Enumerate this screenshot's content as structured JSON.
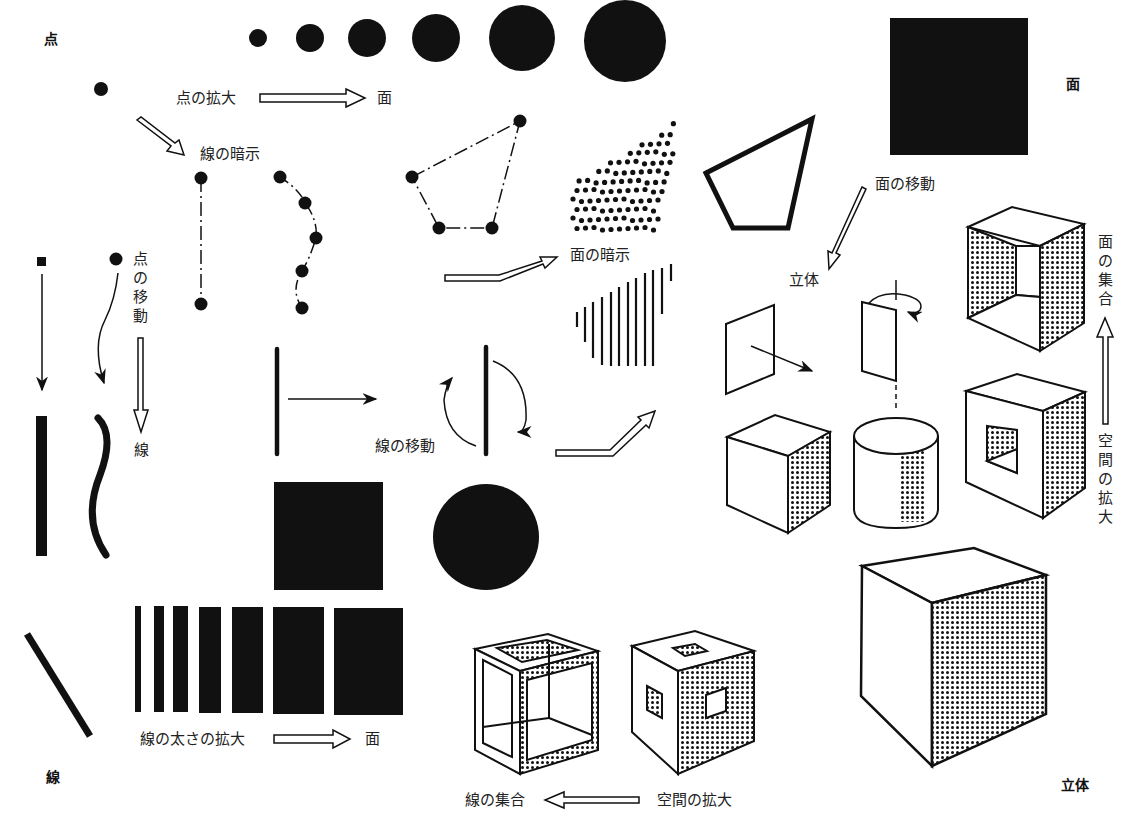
{
  "diagram": {
    "type": "concept-diagram",
    "theme": "point-line-plane-solid",
    "colors": {
      "ink": "#111111",
      "paper": "#ffffff",
      "text": "#222222"
    },
    "corner_labels": {
      "point": "点",
      "plane": "面",
      "line": "線",
      "solid": "立体"
    },
    "labels": {
      "point_enlarge": "点の拡大",
      "point_enlarge_result": "面",
      "line_suggestion": "線の暗示",
      "point_movement": "点の移動",
      "point_movement_result": "線",
      "plane_suggestion": "面の暗示",
      "line_movement": "線の移動",
      "plane_movement": "面の移動",
      "plane_movement_result": "立体",
      "plane_collection": "面の集合",
      "space_enlarge_right": "空間の拡大",
      "line_thickness_enlarge": "線の太さの拡大",
      "line_thickness_result": "面",
      "line_collection": "線の集合",
      "space_enlarge_bottom": "空間の拡大"
    },
    "nodes": [
      {
        "id": "growing-dots",
        "count": 6,
        "description": "dots increasing in size"
      },
      {
        "id": "single-point",
        "description": "single dot"
      },
      {
        "id": "dotted-line-suggestion",
        "description": "two dots connected by dash-dot line"
      },
      {
        "id": "dotted-curve-suggestion",
        "description": "five dots along dash-dot curve"
      },
      {
        "id": "dotted-quadrilateral",
        "description": "four dots joined by dash-dot lines"
      },
      {
        "id": "dot-field",
        "description": "field of dots forming a plane"
      },
      {
        "id": "hatch-field",
        "description": "parallel lines forming a plane"
      },
      {
        "id": "pentagon-outline",
        "description": "thick outlined pentagon"
      },
      {
        "id": "black-square-plane",
        "description": "large black square"
      },
      {
        "id": "line-translation",
        "description": "vertical bar with arrow"
      },
      {
        "id": "line-rotation",
        "description": "vertical bar with rotation arrows"
      },
      {
        "id": "black-square",
        "description": "black square"
      },
      {
        "id": "black-circle",
        "description": "black circle"
      },
      {
        "id": "thickening-bars",
        "count": 7,
        "description": "bars increasing in width"
      },
      {
        "id": "plane-translation",
        "description": "plane moving to make a cube"
      },
      {
        "id": "plane-rotation",
        "description": "plane rotating to make a cylinder"
      },
      {
        "id": "open-box",
        "description": "cube of planes"
      },
      {
        "id": "hollow-cube",
        "description": "cube with window"
      },
      {
        "id": "frame-cube",
        "description": "cube made of lines/bars"
      },
      {
        "id": "perforated-cube",
        "description": "cube with holes"
      },
      {
        "id": "large-cube",
        "description": "large solid cube"
      }
    ]
  }
}
